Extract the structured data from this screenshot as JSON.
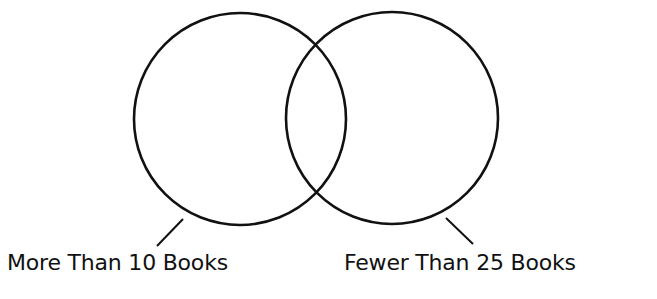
{
  "diagram": {
    "type": "venn",
    "sets": [
      {
        "id": "left",
        "label": "More Than 10 Books",
        "circle": {
          "cx": 240,
          "cy": 119,
          "r": 106
        },
        "leader": {
          "x1": 183,
          "y1": 219,
          "x2": 157,
          "y2": 246
        }
      },
      {
        "id": "right",
        "label": "Fewer Than 25 Books",
        "circle": {
          "cx": 392,
          "cy": 118,
          "r": 106
        },
        "leader": {
          "x1": 446,
          "y1": 218,
          "x2": 473,
          "y2": 244
        }
      }
    ],
    "stroke_color": "#111111",
    "background": "#ffffff"
  }
}
